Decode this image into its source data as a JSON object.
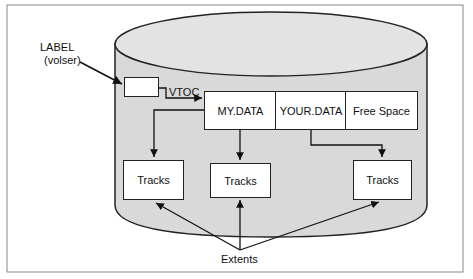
{
  "diagram": {
    "label_callout": {
      "line1": "LABEL",
      "line2": "(volser)"
    },
    "vtoc_label": "VTOC",
    "datasets": [
      {
        "name": "MY.DATA"
      },
      {
        "name": "YOUR.DATA"
      },
      {
        "name": "Free Space"
      }
    ],
    "tracks": [
      {
        "label": "Tracks"
      },
      {
        "label": "Tracks"
      },
      {
        "label": "Tracks"
      }
    ],
    "extents_label": "Extents",
    "colors": {
      "cylinder_fill": "#d9d9d9",
      "stroke": "#222222",
      "frame": "#888888"
    }
  }
}
